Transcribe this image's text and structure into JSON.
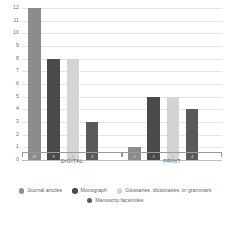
{
  "chart_data": {
    "type": "bar",
    "title": "",
    "subtitle": "",
    "xlabel": "",
    "ylabel": "",
    "categories": [
      "DIGITAL",
      "PRINT"
    ],
    "series": [
      {
        "name": "Journal articles",
        "color": "#8c8c8c",
        "values": [
          12,
          1
        ]
      },
      {
        "name": "Monograph",
        "color": "#4a4a4a",
        "values": [
          8,
          5
        ]
      },
      {
        "name": "Glossaries, dictionaries, or grammars",
        "color": "#d4d4d4",
        "values": [
          8,
          5
        ]
      },
      {
        "name": "Manuscrip facsimiles",
        "color": "#5a5a5a",
        "values": [
          3,
          4
        ]
      }
    ],
    "ylim": [
      0,
      12
    ],
    "yticks": [
      0,
      1,
      2,
      3,
      4,
      5,
      6,
      7,
      8,
      9,
      10,
      11,
      12
    ],
    "ytick_labels": [
      "0",
      "1",
      "2",
      "3",
      "4",
      "5",
      "6",
      "7",
      "8",
      "9",
      "10",
      "11",
      "12"
    ],
    "grid": true,
    "legend_position": "bottom",
    "grouped": true
  },
  "legend": {
    "rows": [
      [
        {
          "label": "Journal articles",
          "color": "#8c8c8c"
        },
        {
          "label": "Monograph",
          "color": "#4a4a4a"
        },
        {
          "label": "Glossaries, dictionaries, or grammars",
          "color": "#d4d4d4"
        }
      ],
      [
        {
          "label": "Manuscrip facsimiles",
          "color": "#5a5a5a"
        }
      ]
    ]
  },
  "colors": {
    "journal_articles": "#8c8c8c",
    "monograph": "#4a4a4a",
    "glossaries": "#d4d4d4",
    "manuscript_facsimiles": "#5a5a5a",
    "gridline": "#e4e4e4",
    "axis": "#9a9a9a",
    "text": "#5f5f5f",
    "background": "#ffffff"
  }
}
